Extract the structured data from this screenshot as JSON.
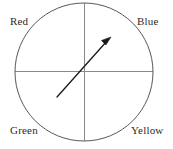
{
  "figure": {
    "type": "spinner-wheel-diagram",
    "background_color": "#ffffff",
    "circle": {
      "center_x": 84,
      "center_y": 72,
      "radius": 69,
      "stroke_color": "#585858",
      "stroke_width": 1
    },
    "axes": {
      "horizontal_label": "horizontal-diameter",
      "vertical_label": "vertical-diameter",
      "stroke_color": "#8a8a8a",
      "stroke_width": 1
    },
    "pointer": {
      "tail_x": 57,
      "tail_y": 97,
      "tip_x": 110,
      "tip_y": 38,
      "stroke_color": "#1a1a1a",
      "stroke_width": 1.3,
      "points_to": "Blue",
      "direction_degrees": 48
    },
    "labels": [
      {
        "id": "red",
        "text": "Red",
        "quadrant": "top-left",
        "color": "#2b2b2b"
      },
      {
        "id": "blue",
        "text": "Blue",
        "quadrant": "top-right",
        "color": "#2b2b2b"
      },
      {
        "id": "green",
        "text": "Green",
        "quadrant": "bottom-left",
        "color": "#2b2b2b"
      },
      {
        "id": "yellow",
        "text": "Yellow",
        "quadrant": "bottom-right",
        "color": "#2b2b2b"
      }
    ]
  }
}
